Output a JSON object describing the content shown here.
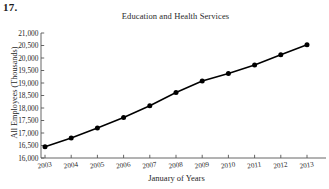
{
  "problem": {
    "number": "17."
  },
  "chart_data": {
    "type": "line",
    "title": "Education and Health Services",
    "xlabel": "January of Years",
    "ylabel": "All Employees (Thousands)",
    "categories": [
      "2003",
      "2004",
      "2005",
      "2006",
      "2007",
      "2008",
      "2009",
      "2010",
      "2011",
      "2012",
      "2013"
    ],
    "values": [
      16450,
      16800,
      17200,
      17620,
      18090,
      18620,
      19080,
      19380,
      19720,
      20130,
      20530
    ],
    "series": [
      {
        "name": "All Employees",
        "values": [
          16450,
          16800,
          17200,
          17620,
          18090,
          18620,
          19080,
          19380,
          19720,
          20130,
          20530
        ]
      }
    ],
    "ylim": [
      16000,
      21000
    ],
    "ytick_step": 500,
    "ytick_labels": [
      "16,000",
      "16,500",
      "17,000",
      "17,500",
      "18,000",
      "18,500",
      "19,000",
      "19,500",
      "20,000",
      "20,500",
      "21,000"
    ],
    "ytick_values": [
      16000,
      16500,
      17000,
      17500,
      18000,
      18500,
      19000,
      19500,
      20000,
      20500,
      21000
    ],
    "xtick_labels": [
      "2003",
      "2004",
      "2005",
      "2006",
      "2007",
      "2008",
      "2009",
      "2010",
      "2011",
      "2012",
      "2013"
    ],
    "grid": false,
    "legend": "none",
    "marker": "filled-circle",
    "line_color": "#000000",
    "marker_color": "#000000",
    "axis_color": "#555555",
    "background_color": "#ffffff"
  }
}
